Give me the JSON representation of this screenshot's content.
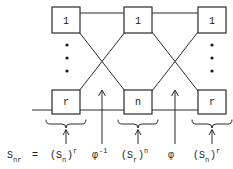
{
  "figure": {
    "background_color": "#ffffff",
    "line_color": "#2b2b2b",
    "text_color": "#1a1a1a"
  },
  "diagram": {
    "top_row": [
      {
        "label": "1",
        "name": "node-top-left"
      },
      {
        "label": "1",
        "name": "node-top-middle"
      },
      {
        "label": "1",
        "name": "node-top-right"
      }
    ],
    "bottom_row": [
      {
        "label": "r",
        "name": "node-bottom-left"
      },
      {
        "label": "n",
        "name": "node-bottom-middle"
      },
      {
        "label": "r",
        "name": "node-bottom-right"
      }
    ],
    "vertical_ellipsis": [
      {
        "name": "ellipsis-left",
        "dots": 3
      },
      {
        "name": "ellipsis-right",
        "dots": 3
      }
    ],
    "crossings": 2,
    "arrows": [
      {
        "name": "arrow-phi-inverse",
        "target": "phi-inverse"
      },
      {
        "name": "arrow-phi",
        "target": "phi"
      }
    ],
    "braces": [
      {
        "name": "brace-left",
        "target": "(S_n)^r"
      },
      {
        "name": "brace-middle",
        "target": "(S_r)^n"
      },
      {
        "name": "brace-right",
        "target": "(S_n)^r"
      }
    ]
  },
  "equation": {
    "lhs": {
      "base": "S",
      "sub": "nr"
    },
    "equals": "=",
    "terms": [
      {
        "name": "term-sn-r",
        "open": "(",
        "base": "S",
        "sub": "n",
        "close": ")",
        "sup": "r"
      },
      {
        "name": "term-phi-inverse",
        "base": "φ",
        "sup": "-1"
      },
      {
        "name": "term-sr-n",
        "open": "(",
        "base": "S",
        "sub": "r",
        "close": ")",
        "sup": "n"
      },
      {
        "name": "term-phi",
        "base": "φ",
        "sup": ""
      },
      {
        "name": "term-sn-r-2",
        "open": "(",
        "base": "S",
        "sub": "n",
        "close": ")",
        "sup": "r"
      }
    ],
    "plain": "S_nr = (S_n)^r  φ^-1  (S_r)^n  φ  (S_n)^r"
  }
}
